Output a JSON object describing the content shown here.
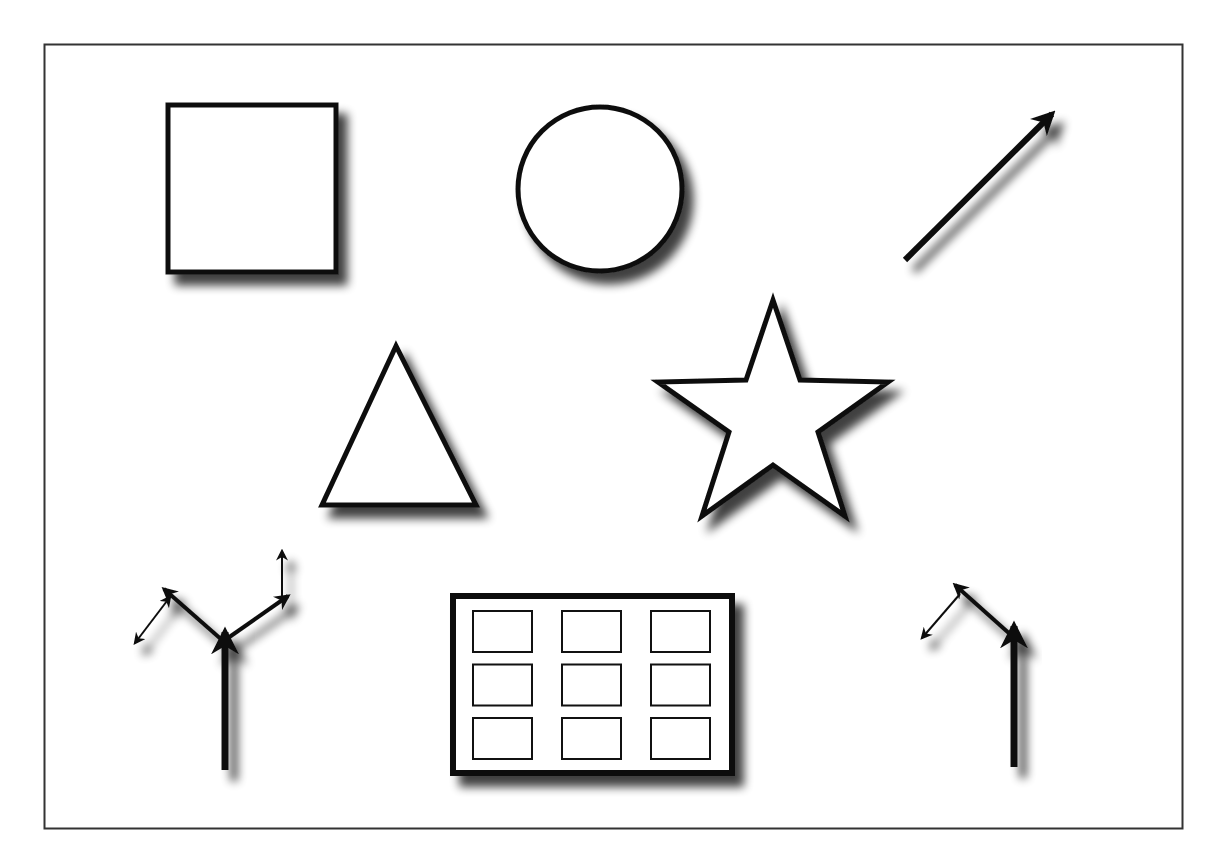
{
  "diagram": {
    "colors": {
      "background": "#ffffff",
      "stroke": "#111111",
      "frame": "#333333",
      "shadow": "#000000",
      "fill": "#ffffff"
    },
    "shapes": [
      {
        "id": "square",
        "kind": "rectangle"
      },
      {
        "id": "circle",
        "kind": "ellipse"
      },
      {
        "id": "arrow",
        "kind": "line-arrow"
      },
      {
        "id": "triangle",
        "kind": "polygon",
        "sides": 3
      },
      {
        "id": "star",
        "kind": "star",
        "points": 5
      },
      {
        "id": "branching-connector",
        "kind": "connector",
        "branches": 4
      },
      {
        "id": "table-grid",
        "kind": "grid",
        "rows": 3,
        "columns": 3
      },
      {
        "id": "elbow-connector",
        "kind": "connector",
        "branches": 2
      }
    ]
  }
}
